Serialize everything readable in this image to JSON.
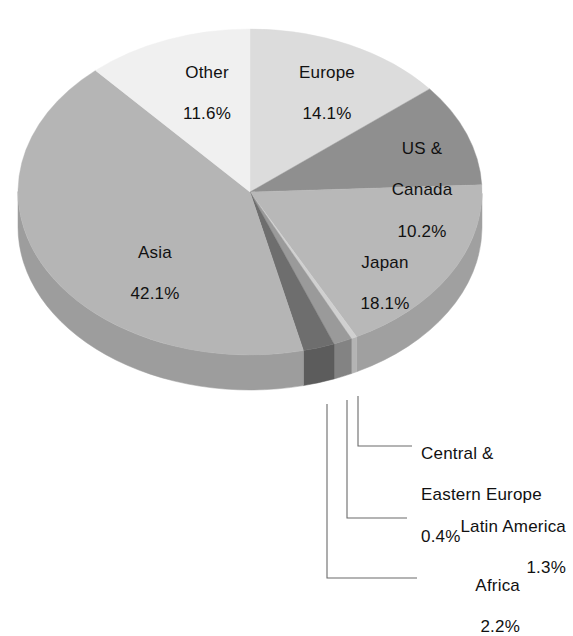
{
  "chart_data": {
    "type": "pie",
    "title": "",
    "subtitle": "",
    "xlabel": "",
    "ylabel": "",
    "legend_position": "none",
    "grid": false,
    "units": "percent",
    "style": "3d-exploded-none",
    "categories": [
      "Europe",
      "US & Canada",
      "Japan",
      "Central & Eastern Europe",
      "Latin America",
      "Africa",
      "Asia",
      "Other"
    ],
    "values": [
      14.1,
      10.2,
      18.1,
      0.4,
      1.3,
      2.2,
      42.1,
      11.6
    ],
    "slices": [
      {
        "name": "Europe",
        "label": "Europe",
        "value": 14.1,
        "value_text": "14.1%",
        "color": "#dcdcdc",
        "side_color": "#c3c3c3",
        "label_placement": "inside"
      },
      {
        "name": "US & Canada",
        "label": "US &\nCanada",
        "value": 10.2,
        "value_text": "10.2%",
        "color": "#8f8f8f",
        "side_color": "#7a7a7a",
        "label_placement": "inside"
      },
      {
        "name": "Japan",
        "label": "Japan",
        "value": 18.1,
        "value_text": "18.1%",
        "color": "#b8b8b8",
        "side_color": "#a0a0a0",
        "label_placement": "inside"
      },
      {
        "name": "Central & Eastern Europe",
        "label": "Central &\nEastern Europe",
        "value": 0.4,
        "value_text": "0.4%",
        "color": "#d0d0d0",
        "side_color": "#b4b4b4",
        "label_placement": "callout"
      },
      {
        "name": "Latin America",
        "label": "Latin America",
        "value": 1.3,
        "value_text": "1.3%",
        "color": "#9a9a9a",
        "side_color": "#838383",
        "label_placement": "callout"
      },
      {
        "name": "Africa",
        "label": "Africa",
        "value": 2.2,
        "value_text": "2.2%",
        "color": "#6e6e6e",
        "side_color": "#5c5c5c",
        "label_placement": "callout"
      },
      {
        "name": "Asia",
        "label": "Asia",
        "value": 42.1,
        "value_text": "42.1%",
        "color": "#b5b5b5",
        "side_color": "#9d9d9d",
        "label_placement": "inside"
      },
      {
        "name": "Other",
        "label": "Other",
        "value": 11.6,
        "value_text": "11.6%",
        "color": "#f0f0f0",
        "side_color": "#d6d6d6",
        "label_placement": "inside"
      }
    ]
  },
  "labels": {
    "other": {
      "name": "Other",
      "value": "11.6%"
    },
    "europe": {
      "name": "Europe",
      "value": "14.1%"
    },
    "us_canada": {
      "name": "US &",
      "name2": "Canada",
      "value": "10.2%"
    },
    "japan": {
      "name": "Japan",
      "value": "18.1%"
    },
    "asia": {
      "name": "Asia",
      "value": "42.1%"
    },
    "central_eastern_europe": {
      "name": "Central &",
      "name2": "Eastern Europe",
      "value": "0.4%"
    },
    "latin_america": {
      "name": "Latin America",
      "value": "1.3%"
    },
    "africa": {
      "name": "Africa",
      "value": "2.2%"
    }
  },
  "colors": {
    "background": "#ffffff",
    "text": "#111111",
    "leader_line": "#6b6b6b"
  }
}
